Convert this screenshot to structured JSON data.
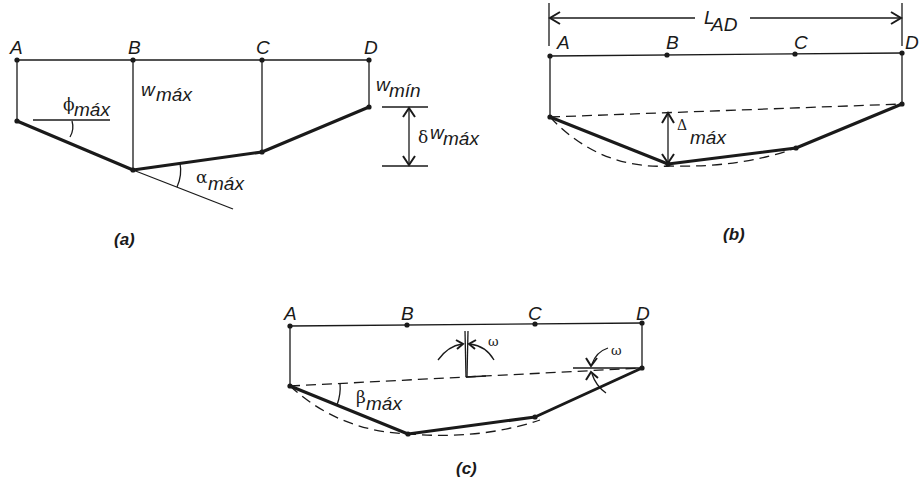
{
  "panels": {
    "a": {
      "caption": "(a)",
      "points": [
        "A",
        "B",
        "C",
        "D"
      ],
      "labels": {
        "phi": "ϕ",
        "phi_sub": "máx",
        "w": "w",
        "w_sub": "máx",
        "wmin": "w",
        "wmin_sub": "mín",
        "alpha": "α",
        "alpha_sub": "máx",
        "delta": "δ",
        "dw": "w",
        "dw_sub": "máx"
      }
    },
    "b": {
      "caption": "(b)",
      "points": [
        "A",
        "B",
        "C",
        "D"
      ],
      "labels": {
        "L": "L",
        "L_sub": "AD",
        "Delta": "Δ",
        "Delta_sub": "máx"
      }
    },
    "c": {
      "caption": "(c)",
      "points": [
        "A",
        "B",
        "C",
        "D"
      ],
      "labels": {
        "beta": "β",
        "beta_sub": "máx",
        "omega1": "ω",
        "omega2": "ω"
      }
    }
  }
}
